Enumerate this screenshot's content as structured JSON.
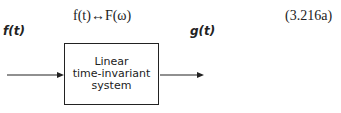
{
  "equation": {
    "text": "f(t)↔F(ω)",
    "number": "(3.216a)"
  },
  "diagram": {
    "input_label": "f(t)",
    "output_label": "g(t)",
    "block": {
      "lines": [
        "Linear",
        "time-invariant",
        "system"
      ]
    }
  }
}
